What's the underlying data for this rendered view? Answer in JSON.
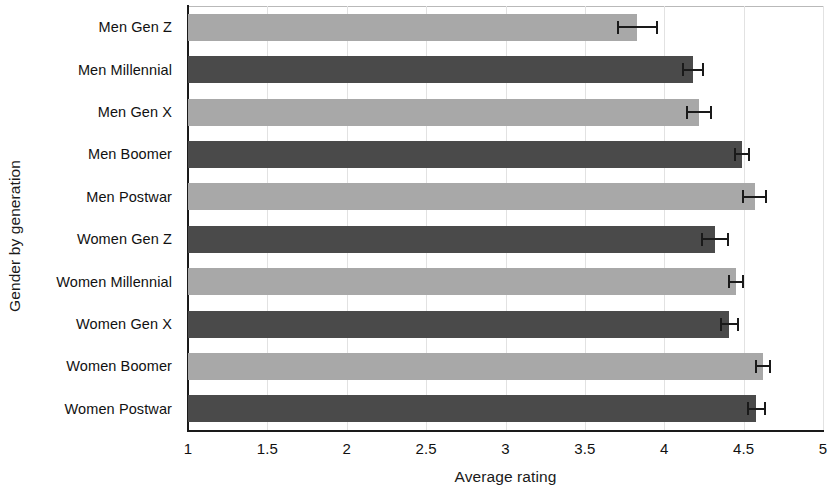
{
  "chart_data": {
    "type": "bar",
    "orientation": "horizontal",
    "title": "",
    "xlabel": "Average rating",
    "ylabel": "Gender by generation",
    "xlim": [
      1,
      5
    ],
    "xticks": [
      "1",
      "1.5",
      "2",
      "2.5",
      "3",
      "3.5",
      "4",
      "4.5",
      "5"
    ],
    "xtick_values": [
      1,
      1.5,
      2,
      2.5,
      3,
      3.5,
      4,
      4.5,
      5
    ],
    "grid": true,
    "legend": "none",
    "categories": [
      "Men Gen Z",
      "Men Millennial",
      "Men Gen X",
      "Men Boomer",
      "Men Postwar",
      "Women Gen Z",
      "Women Millennial",
      "Women Gen X",
      "Women Boomer",
      "Women Postwar"
    ],
    "values": [
      3.83,
      4.18,
      4.22,
      4.49,
      4.57,
      4.32,
      4.45,
      4.41,
      4.62,
      4.58
    ],
    "errors": [
      0.13,
      0.07,
      0.08,
      0.05,
      0.08,
      0.09,
      0.05,
      0.06,
      0.05,
      0.06
    ],
    "bar_colors": [
      "#a8a8a8",
      "#4a4a4a",
      "#a8a8a8",
      "#4a4a4a",
      "#a8a8a8",
      "#4a4a4a",
      "#a8a8a8",
      "#4a4a4a",
      "#a8a8a8",
      "#4a4a4a"
    ],
    "colors": {
      "light_bar": "#a8a8a8",
      "dark_bar": "#4a4a4a",
      "axis": "#1a1a1a",
      "gridline": "#e2e2e2",
      "background": "#ffffff",
      "error_bar": "#1a1a1a"
    }
  }
}
